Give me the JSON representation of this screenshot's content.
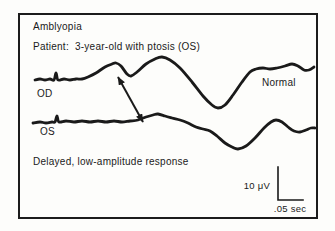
{
  "figure": {
    "title": "Amblyopia",
    "patient_line": "Patient:  3-year-old with ptosis (OS)",
    "caption": "Delayed, low-amplitude response",
    "labels": {
      "top_trace": "OD",
      "bottom_trace": "OS",
      "right_annotation": "Normal"
    },
    "scale": {
      "amplitude": "10 μV",
      "time": ".05 sec"
    },
    "colors": {
      "ink": "#1a1a1a",
      "paper": "#fdfdfb"
    }
  },
  "chart_data": {
    "type": "line",
    "title": "Amblyopia",
    "annotations": [
      "Normal",
      "Delayed, low-amplitude response"
    ],
    "scale_labels": {
      "vertical": "10 μV",
      "horizontal": ".05 sec"
    },
    "legend_position": "inline-trace-labels",
    "grid": false,
    "series": [
      {
        "name": "OD",
        "points": [
          [
            15,
            65
          ],
          [
            20,
            64
          ],
          [
            25,
            65
          ],
          [
            30,
            64
          ],
          [
            34,
            65
          ],
          [
            36,
            58
          ],
          [
            38,
            65
          ],
          [
            44,
            64
          ],
          [
            50,
            65
          ],
          [
            56,
            64
          ],
          [
            62,
            64
          ],
          [
            68,
            62
          ],
          [
            76,
            58
          ],
          [
            85,
            52
          ],
          [
            92,
            49
          ],
          [
            96,
            48
          ],
          [
            101,
            51
          ],
          [
            107,
            59
          ],
          [
            111,
            61
          ],
          [
            117,
            57
          ],
          [
            126,
            49
          ],
          [
            135,
            44
          ],
          [
            142,
            42
          ],
          [
            150,
            45
          ],
          [
            160,
            53
          ],
          [
            172,
            67
          ],
          [
            183,
            81
          ],
          [
            192,
            90
          ],
          [
            198,
            93
          ],
          [
            205,
            90
          ],
          [
            213,
            80
          ],
          [
            222,
            67
          ],
          [
            230,
            57
          ],
          [
            236,
            54
          ],
          [
            243,
            53
          ],
          [
            250,
            54
          ],
          [
            257,
            53
          ],
          [
            265,
            51
          ],
          [
            272,
            49
          ],
          [
            278,
            51
          ],
          [
            284,
            55
          ],
          [
            289,
            55
          ],
          [
            294,
            52
          ]
        ]
      },
      {
        "name": "OS",
        "points": [
          [
            13,
            108
          ],
          [
            20,
            107
          ],
          [
            26,
            108
          ],
          [
            32,
            107
          ],
          [
            35,
            107
          ],
          [
            37,
            101
          ],
          [
            39,
            107
          ],
          [
            46,
            106
          ],
          [
            54,
            107
          ],
          [
            62,
            106
          ],
          [
            70,
            107
          ],
          [
            78,
            106
          ],
          [
            86,
            107
          ],
          [
            94,
            106
          ],
          [
            102,
            107
          ],
          [
            110,
            106
          ],
          [
            118,
            105
          ],
          [
            126,
            102
          ],
          [
            133,
            100
          ],
          [
            138,
            99
          ],
          [
            145,
            101
          ],
          [
            152,
            103
          ],
          [
            160,
            105
          ],
          [
            168,
            108
          ],
          [
            176,
            112
          ],
          [
            183,
            114
          ],
          [
            190,
            116
          ],
          [
            197,
            121
          ],
          [
            205,
            128
          ],
          [
            212,
            132
          ],
          [
            218,
            134
          ],
          [
            226,
            131
          ],
          [
            235,
            123
          ],
          [
            244,
            113
          ],
          [
            251,
            107
          ],
          [
            256,
            105
          ],
          [
            262,
            107
          ],
          [
            268,
            112
          ],
          [
            274,
            116
          ],
          [
            280,
            117
          ],
          [
            286,
            115
          ],
          [
            291,
            113
          ],
          [
            295,
            113
          ]
        ]
      }
    ],
    "latency_arrow": {
      "from": [
        98,
        62
      ],
      "to": [
        123,
        107
      ]
    },
    "scale_bar": {
      "points": [
        [
          258,
          152
        ],
        [
          258,
          185
        ],
        [
          283,
          185
        ]
      ]
    },
    "stroke": {
      "trace_width": 2.8,
      "arrow_width": 2,
      "scale_bar_width": 1.6
    }
  }
}
